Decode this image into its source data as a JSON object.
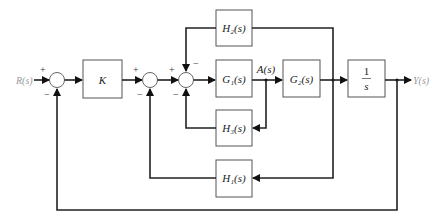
{
  "diagram": {
    "type": "control-system-block-diagram",
    "signals": {
      "input": "R(s)",
      "output": "Y(s)",
      "intermediate": "A(s)"
    },
    "blocks": {
      "K": "K",
      "G1": "G₁(s)",
      "G2": "G₂(s)",
      "H1": "H₁(s)",
      "H2": "H₂(s)",
      "H3": "H₃(s)",
      "integrator_num": "1",
      "integrator_den": "s"
    },
    "summing_junctions": [
      {
        "id": "S1",
        "signs": [
          "+",
          "−"
        ]
      },
      {
        "id": "S2",
        "signs": [
          "+",
          "−"
        ]
      },
      {
        "id": "S3",
        "signs": [
          "+",
          "−",
          "−"
        ]
      }
    ],
    "signs": {
      "plus": "+",
      "minus": "−"
    }
  }
}
